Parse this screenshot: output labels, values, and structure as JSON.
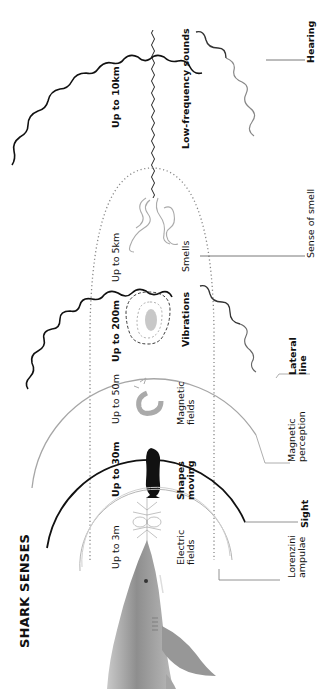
{
  "title": "SHARK SENSES",
  "senses": [
    {
      "id": "hearing",
      "range": "Up to 10km",
      "stimulus": "Low-frequency sounds",
      "organ": "Hearing"
    },
    {
      "id": "smell",
      "range": "Up to 5km",
      "stimulus": "Smells",
      "organ": "Sense of smell"
    },
    {
      "id": "lateral_line",
      "range": "Up to 200m",
      "stimulus": "Vibrations",
      "organ": "Lateral line"
    },
    {
      "id": "magnetic",
      "range": "Up to 50m",
      "stimulus": "Magnetic fields",
      "organ": "Magnetic perception"
    },
    {
      "id": "sight",
      "range": "Up to 30m",
      "stimulus": "Shapes moving",
      "organ": "Sight"
    },
    {
      "id": "electric",
      "range": "Up to 3m",
      "stimulus": "Electric fields",
      "organ": "Lorenzini ampulae"
    }
  ],
  "labels": {
    "hearing_range": "Up to 10km",
    "hearing_stimulus": "Low-frequency sounds",
    "hearing_organ": "Hearing",
    "smell_range": "Up to 5km",
    "smell_stimulus": "Smells",
    "smell_organ": "Sense of smell",
    "lateral_range": "Up to 200m",
    "lateral_stimulus": "Vibrations",
    "lateral_organ_1": "Lateral",
    "lateral_organ_2": "line",
    "magnetic_range": "Up to 50m",
    "magnetic_stimulus_1": "Magnetic",
    "magnetic_stimulus_2": "fields",
    "magnetic_organ_1": "Magnetic",
    "magnetic_organ_2": "perception",
    "sight_range": "Up to 30m",
    "sight_stimulus_1": "Shapes",
    "sight_stimulus_2": "moving",
    "sight_organ": "Sight",
    "electric_range": "Up to 3m",
    "electric_stimulus_1": "Electric",
    "electric_stimulus_2": "fields",
    "electric_organ_1": "Lorenzini",
    "electric_organ_2": "ampulae"
  },
  "icons": [
    "sound-wave-icon",
    "smell-wisps-icon",
    "vibration-ripples-icon",
    "magnet-icon",
    "fish-silhouette-icon",
    "electric-field-icon",
    "shark-illustration"
  ],
  "colors": {
    "ink": "#111111",
    "gray": "#9a9a9a",
    "light_gray": "#bdbdbd",
    "shark": "#8c8c8c"
  }
}
